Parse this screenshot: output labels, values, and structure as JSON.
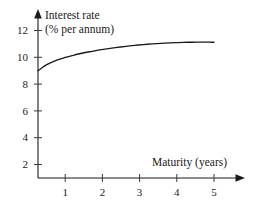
{
  "chart_data": {
    "type": "line",
    "title": "",
    "subtitle": "",
    "xlabel": "Maturity (years)",
    "ylabel_line1": "Interest rate",
    "ylabel_line2": "(% per annum)",
    "ylabel": "Interest rate (% per annum)",
    "xlim": [
      0,
      5.5
    ],
    "ylim": [
      0,
      12.8
    ],
    "grid": false,
    "legend": null,
    "xticks": [
      1,
      2,
      3,
      4,
      5
    ],
    "xtick_labels": [
      "1",
      "2",
      "3",
      "4",
      "5"
    ],
    "yticks": [
      2,
      4,
      6,
      8,
      10,
      12
    ],
    "ytick_labels": [
      "2",
      "4",
      "6",
      "8",
      "10",
      "12"
    ],
    "series": [
      {
        "name": "Zero-coupon yield curve",
        "x": [
          0.0,
          0.25,
          0.5,
          0.75,
          1.0,
          1.25,
          1.5,
          1.75,
          2.0,
          2.25,
          2.5,
          2.75,
          3.0,
          3.25,
          3.5,
          3.75,
          4.0,
          4.25,
          4.5,
          4.75,
          5.0
        ],
        "values": [
          9.0,
          9.45,
          9.75,
          9.97,
          10.15,
          10.3,
          10.43,
          10.55,
          10.65,
          10.74,
          10.82,
          10.89,
          10.95,
          11.0,
          11.04,
          11.08,
          11.1,
          11.12,
          11.13,
          11.13,
          11.12
        ]
      }
    ],
    "curve_color": "#1a1a1a",
    "axis_color": "#1a1a1a"
  },
  "axes": {
    "x_arrow": "arrow-right",
    "y_arrow": "arrow-up"
  }
}
